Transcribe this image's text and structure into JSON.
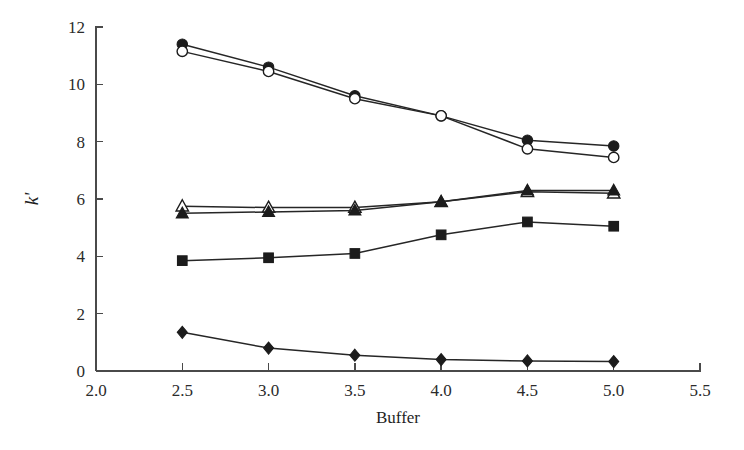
{
  "chart_data": {
    "type": "line",
    "title": "",
    "subtitle": "",
    "xlabel": "Buffer",
    "ylabel": "k'",
    "xlim": [
      2.0,
      5.5
    ],
    "ylim": [
      0,
      12
    ],
    "grid": false,
    "legend": "none",
    "x": [
      2.5,
      3.0,
      3.5,
      4.0,
      4.5,
      5.0
    ],
    "x_ticks": [
      "2.0",
      "2.5",
      "3.0",
      "3.5",
      "4.0",
      "4.5",
      "5.0",
      "5.5"
    ],
    "x_tick_values": [
      2.0,
      2.5,
      3.0,
      3.5,
      4.0,
      4.5,
      5.0,
      5.5
    ],
    "y_ticks": [
      "0",
      "2",
      "4",
      "6",
      "8",
      "10",
      "12"
    ],
    "y_tick_values": [
      0,
      2,
      4,
      6,
      8,
      10,
      12
    ],
    "series": [
      {
        "name": "filled-circle-series",
        "marker": "circle-filled",
        "values": [
          11.4,
          10.6,
          9.6,
          8.9,
          8.05,
          7.85
        ]
      },
      {
        "name": "open-circle-series",
        "marker": "circle-open",
        "values": [
          11.15,
          10.45,
          9.5,
          8.9,
          7.75,
          7.45
        ]
      },
      {
        "name": "open-triangle-series",
        "marker": "triangle-open",
        "values": [
          5.75,
          5.7,
          5.7,
          5.9,
          6.25,
          6.2
        ]
      },
      {
        "name": "filled-triangle-series",
        "marker": "triangle-filled",
        "values": [
          5.5,
          5.55,
          5.6,
          5.9,
          6.3,
          6.3
        ]
      },
      {
        "name": "filled-square-series",
        "marker": "square-filled",
        "values": [
          3.85,
          3.95,
          4.1,
          4.75,
          5.2,
          5.05
        ]
      },
      {
        "name": "filled-diamond-series",
        "marker": "diamond-filled",
        "values": [
          1.35,
          0.8,
          0.55,
          0.4,
          0.35,
          0.33
        ]
      }
    ]
  },
  "colors": {
    "axis": "#4a4a4a",
    "line": "#262626",
    "marker_fill": "#1c1c1c",
    "marker_open_fill": "#ffffff",
    "background": "#ffffff"
  }
}
